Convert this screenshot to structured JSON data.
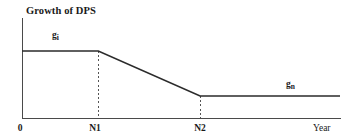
{
  "chart_data": {
    "type": "line",
    "title": "Growth of DPS",
    "xlabel": "Year",
    "ylabel": "",
    "grid": false,
    "legend": "none",
    "xlim": [
      0,
      1
    ],
    "ylim": [
      0,
      1
    ],
    "x_tick_labels": [
      "0",
      "N1",
      "N2"
    ],
    "x_axis_end_label": "Year",
    "annotations": [
      {
        "text": "g",
        "subscript": "i",
        "meaning": "high initial growth rate"
      },
      {
        "text": "g",
        "subscript": "n",
        "meaning": "stable terminal growth rate"
      }
    ],
    "series": [
      {
        "name": "DPS growth rate",
        "points": [
          {
            "x": 0.0,
            "y": 0.67,
            "phase": "high-growth"
          },
          {
            "x": 0.24,
            "y": 0.67,
            "phase": "high-growth"
          },
          {
            "x": 0.56,
            "y": 0.22,
            "phase": "transition-decline"
          },
          {
            "x": 1.0,
            "y": 0.22,
            "phase": "stable-growth"
          }
        ]
      }
    ],
    "guides": [
      {
        "at_label": "N1",
        "x": 0.24,
        "from_y": 0.67,
        "to_y": 0.0,
        "style": "dashed"
      },
      {
        "at_label": "N2",
        "x": 0.56,
        "from_y": 0.22,
        "to_y": 0.0,
        "style": "dashed"
      }
    ],
    "colors": {
      "series": "#2b2b2b",
      "axis": "#4a4a4a",
      "guide": "#555555",
      "text": "#1a1a1a",
      "background": "#ffffff"
    }
  },
  "labels": {
    "title": "Growth of DPS",
    "gi_base": "g",
    "gi_sub": "i",
    "gn_base": "g",
    "gn_sub": "n",
    "origin": "0",
    "n1": "N1",
    "n2": "N2",
    "year": "Year"
  }
}
